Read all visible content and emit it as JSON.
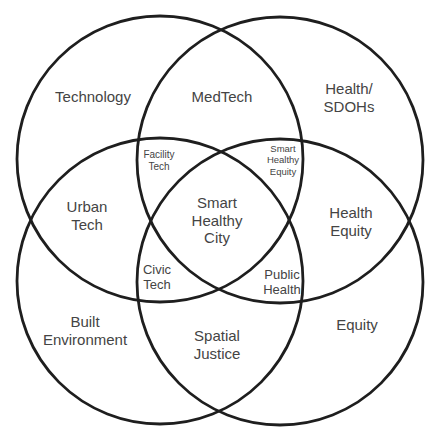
{
  "diagram": {
    "type": "venn",
    "circles": [
      {
        "name": "Technology",
        "cx": 160,
        "cy": 159,
        "r": 143
      },
      {
        "name": "Health/SDOHs",
        "cx": 280,
        "cy": 160,
        "r": 143
      },
      {
        "name": "Built Environment",
        "cx": 160,
        "cy": 281,
        "r": 143
      },
      {
        "name": "Equity",
        "cx": 280,
        "cy": 282,
        "r": 143
      }
    ],
    "colors": {
      "stroke": "#1e1e1e",
      "text": "#444444",
      "background": "#ffffff"
    }
  },
  "labels": {
    "technology": [
      "Technology"
    ],
    "medtech": [
      "MedTech"
    ],
    "health_sdohs": [
      "Health/",
      "SDOHs"
    ],
    "facility_tech": [
      "Facility",
      "Tech"
    ],
    "smart_healthy_equity": [
      "Smart",
      "Healthy",
      "Equity"
    ],
    "urban_tech": [
      "Urban",
      "Tech"
    ],
    "smart_healthy_city": [
      "Smart",
      "Healthy",
      "City"
    ],
    "health_equity": [
      "Health",
      "Equity"
    ],
    "civic_tech": [
      "Civic",
      "Tech"
    ],
    "public_health": [
      "Public",
      "Health"
    ],
    "built_environment": [
      "Built",
      "Environment"
    ],
    "spatial_justice": [
      "Spatial",
      "Justice"
    ],
    "equity": [
      "Equity"
    ]
  }
}
